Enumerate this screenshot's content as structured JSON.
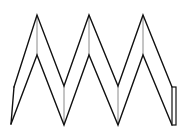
{
  "diagram": {
    "type": "folded-strip-net",
    "colors": {
      "background": "#ffffff",
      "outline": "#111111",
      "fold_line": "#8a8a8a"
    },
    "outer_zigzag": [
      [
        14,
        87
      ],
      [
        37,
        15
      ],
      [
        64,
        86
      ],
      [
        89,
        15
      ],
      [
        118,
        86
      ],
      [
        143,
        15
      ],
      [
        172,
        87
      ]
    ],
    "inner_zigzag": [
      [
        11,
        124
      ],
      [
        37,
        55
      ],
      [
        64,
        125
      ],
      [
        89,
        55
      ],
      [
        118,
        125
      ],
      [
        143,
        55
      ],
      [
        172,
        125
      ]
    ],
    "left_edge": [
      [
        14,
        87
      ],
      [
        11,
        124
      ]
    ],
    "fold_lines": [
      [
        [
          37,
          15
        ],
        [
          37,
          55
        ]
      ],
      [
        [
          64,
          86
        ],
        [
          64,
          125
        ]
      ],
      [
        [
          89,
          15
        ],
        [
          89,
          55
        ]
      ],
      [
        [
          118,
          86
        ],
        [
          118,
          125
        ]
      ],
      [
        [
          143,
          15
        ],
        [
          143,
          55
        ]
      ]
    ],
    "tab": {
      "x": 172,
      "y": 87,
      "width": 4,
      "height": 38
    }
  }
}
